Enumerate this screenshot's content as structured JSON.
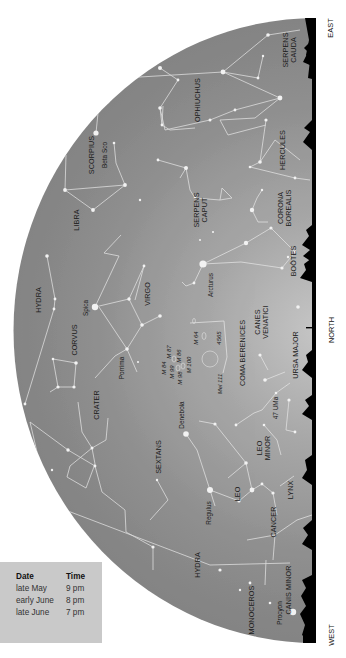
{
  "directions": {
    "east": "EAST",
    "north": "NORTH",
    "west": "WEST"
  },
  "timetable": {
    "headers": [
      "Date",
      "Time"
    ],
    "rows": [
      [
        "late May",
        "9 pm"
      ],
      [
        "early June",
        "8 pm"
      ],
      [
        "late June",
        "7 pm"
      ]
    ]
  },
  "constellations": {
    "serpens_cauda": [
      "SERPENS",
      "CAUDA"
    ],
    "ophiuchus": "OPHIUCHUS",
    "scorpius": "SCORPIUS",
    "hercules": "HERCULES",
    "libra": "LIBRA",
    "serpens_caput": [
      "SERPENS",
      "CAPUT"
    ],
    "corona_borealis": [
      "CORONA",
      "BOREALIS"
    ],
    "bootes": "BOÖTES",
    "hydra_upper": "HYDRA",
    "virgo": "VIRGO",
    "corvus": "CORVUS",
    "canes_venatici": [
      "CANES",
      "VENATICI"
    ],
    "coma_berenices": "COMA BERENICES",
    "ursa_major": "URSA MAJOR",
    "crater": "CRATER",
    "leo_minor": [
      "LEO",
      "MINOR"
    ],
    "sextans": "SEXTANS",
    "leo": "LEO",
    "lynx": "LYNX",
    "cancer": "CANCER",
    "hydra_lower": "HYDRA",
    "canis_minor": "CANIS MINOR",
    "monoceros": "MONOCEROS"
  },
  "stars": {
    "beta_sco": "Beta Sco",
    "arcturus": "Arcturus",
    "spica": "Spica",
    "porrima": "Porrima",
    "denebola": "Denebola",
    "regulus": "Regulus",
    "procyon": "Procyon",
    "uma47": "47 UMa"
  },
  "deep_sky": {
    "m64": "M 64",
    "ngc4565": "4565",
    "m87": "M 87",
    "m86": "M 86",
    "m84": "M 84",
    "m99": "M 99",
    "m100": "M 100",
    "m98": "M 98",
    "mel111": "Mel 111"
  },
  "colors": {
    "sky_edge": "#858585",
    "sky_horizon": "#c4c4c4",
    "horizon": "#000000",
    "lines": "#e8e8e8",
    "table_bg": "#c9c9c9"
  }
}
